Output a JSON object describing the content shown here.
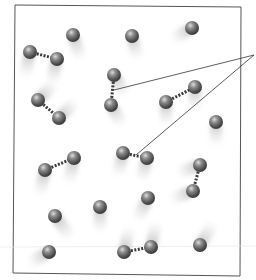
{
  "diagram": {
    "title": "",
    "colors": {
      "atom": "#5a5a5a",
      "atom_highlight": "#d8d8d8",
      "bond": "#3a3a3a",
      "frame": "#555555",
      "motion_trail": "#9a9a9a",
      "callout_line": "#333333"
    },
    "atoms": [
      {
        "id": "a1",
        "x": 73,
        "y": 35,
        "trail_dx": 6,
        "trail_dy": 18
      },
      {
        "id": "a2",
        "x": 132,
        "y": 36,
        "trail_dx": 4,
        "trail_dy": 16
      },
      {
        "id": "a3",
        "x": 192,
        "y": 28,
        "trail_dx": -14,
        "trail_dy": 8
      },
      {
        "id": "a4",
        "x": 216,
        "y": 122,
        "trail_dx": 0,
        "trail_dy": 16
      },
      {
        "id": "a5",
        "x": 148,
        "y": 198,
        "trail_dx": -8,
        "trail_dy": 16
      },
      {
        "id": "a6",
        "x": 100,
        "y": 207,
        "trail_dx": 0,
        "trail_dy": 18
      },
      {
        "id": "a7",
        "x": 55,
        "y": 216,
        "trail_dx": 12,
        "trail_dy": 16
      },
      {
        "id": "a8",
        "x": 49,
        "y": 252,
        "trail_dx": -14,
        "trail_dy": 8
      },
      {
        "id": "a9",
        "x": 200,
        "y": 245,
        "trail_dx": 10,
        "trail_dy": -16
      }
    ],
    "molecules": [
      {
        "id": "m1",
        "a": [
          30,
          52
        ],
        "b": [
          57,
          59
        ],
        "trail_dx": -4,
        "trail_dy": 18,
        "highlighted": false
      },
      {
        "id": "m2",
        "a": [
          38,
          100
        ],
        "b": [
          59,
          118
        ],
        "trail_dx": 12,
        "trail_dy": -12,
        "highlighted": false
      },
      {
        "id": "m3",
        "a": [
          114,
          75
        ],
        "b": [
          111,
          105
        ],
        "trail_dx": 8,
        "trail_dy": 14,
        "highlighted": true
      },
      {
        "id": "m4",
        "a": [
          166,
          102
        ],
        "b": [
          195,
          87
        ],
        "trail_dx": 0,
        "trail_dy": 16,
        "highlighted": false
      },
      {
        "id": "m5",
        "a": [
          45,
          170
        ],
        "b": [
          74,
          158
        ],
        "trail_dx": -4,
        "trail_dy": 18,
        "highlighted": false
      },
      {
        "id": "m6",
        "a": [
          123,
          153
        ],
        "b": [
          147,
          158
        ],
        "trail_dx": -4,
        "trail_dy": 16,
        "highlighted": true
      },
      {
        "id": "m7",
        "a": [
          200,
          165
        ],
        "b": [
          193,
          191
        ],
        "trail_dx": -16,
        "trail_dy": 6,
        "highlighted": false
      },
      {
        "id": "m8",
        "a": [
          124,
          252
        ],
        "b": [
          151,
          247
        ],
        "trail_dx": 4,
        "trail_dy": -18,
        "highlighted": false
      }
    ],
    "callout": {
      "origin": [
        254,
        55
      ],
      "targets": [
        [
          114,
          90
        ],
        [
          136,
          155
        ]
      ]
    }
  }
}
